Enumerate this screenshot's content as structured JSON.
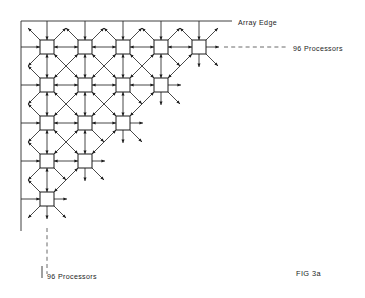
{
  "figure": {
    "id": "FIG 3a",
    "caption_label": "FIG  3a"
  },
  "labels": {
    "array_edge": "Array  Edge",
    "processors_right": "96  Processors",
    "processors_bottom": "96  Processors"
  },
  "colors": {
    "ink": "#1a1a1a",
    "edge": "#2b2b2b",
    "dash": "#5a5a5a",
    "paper": "#ffffff"
  },
  "geometry": {
    "canvas_width": 365,
    "canvas_height": 298,
    "node_size": 14,
    "col_spacing": 38,
    "row_spacing": 38,
    "origin_x": 47,
    "origin_y": 47,
    "stub_length": 13,
    "diag_stub_length": 17
  },
  "chart_data": {
    "type": "diagram",
    "layout": "lower-left triangular mesh",
    "rows": [
      {
        "row": 0,
        "node_count": 5
      },
      {
        "row": 1,
        "node_count": 4
      },
      {
        "row": 2,
        "node_count": 3
      },
      {
        "row": 3,
        "node_count": 2
      },
      {
        "row": 4,
        "node_count": 1
      }
    ],
    "total_nodes": 15,
    "connection_types": [
      "horizontal bidirectional",
      "vertical bidirectional",
      "diagonal down-right bidirectional",
      "diagonal down-left bidirectional"
    ]
  },
  "edges": {
    "top_edge": {
      "x1": 21,
      "y1": 21,
      "x2": 232,
      "y2": 21
    },
    "left_edge": {
      "x1": 21,
      "y1": 21,
      "x2": 21,
      "y2": 231
    },
    "array_edge_label_x": 238,
    "array_edge_label_y": 23,
    "right_dash": {
      "x1": 224,
      "y1": 47,
      "x2": 288,
      "y2": 47
    },
    "right_label_x": 293,
    "right_label_y": 49,
    "bottom_dash": {
      "x1": 47,
      "y1": 228,
      "x2": 47,
      "y2": 274
    },
    "bottom_tick": {
      "x1": 42,
      "y1": 266,
      "x2": 42,
      "y2": 278
    },
    "bottom_label_x": 47,
    "bottom_label_y": 277,
    "caption_x": 296,
    "caption_y": 274
  }
}
